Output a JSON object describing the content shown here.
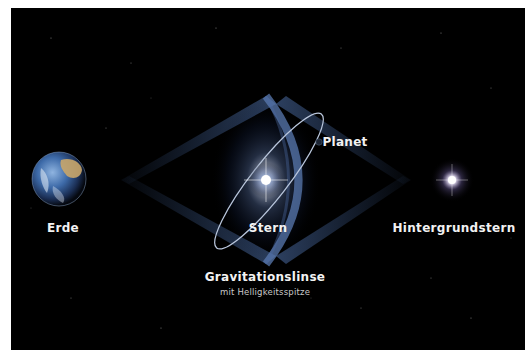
{
  "diagram": {
    "labels": {
      "earth": "Erde",
      "star": "Stern",
      "planet": "Planet",
      "background_star": "Hintergrundstern",
      "lens_title": "Gravitationslinse",
      "lens_subtitle": "mit Helligkeitsspitze"
    },
    "colors": {
      "background": "#000000",
      "beam": "#3c5a8c",
      "lens_ring": "#5a7ab0",
      "orbit": "#b9c6dc",
      "star_glow": "#ffffff",
      "text": "#f2f2f2"
    }
  }
}
